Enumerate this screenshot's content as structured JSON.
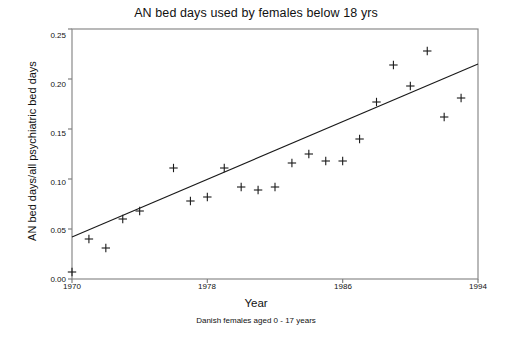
{
  "chart_data": {
    "type": "scatter",
    "title": "AN bed days used by females below 18 yrs",
    "subtitle": "Danish females aged 0 - 17 years",
    "xlabel": "Year",
    "ylabel": "AN bed days/all psychiatric bed days",
    "xlim": [
      1970,
      1994
    ],
    "ylim": [
      0.0,
      0.25
    ],
    "xticks": [
      1970,
      1978,
      1986,
      1994
    ],
    "xtick_labels": [
      "1970",
      "1978",
      "1986",
      "1994"
    ],
    "yticks": [
      0.0,
      0.05,
      0.1,
      0.15,
      0.2,
      0.25
    ],
    "ytick_labels": [
      "0.00",
      "0.05",
      "0.10",
      "0.15",
      "0.20",
      "0.25"
    ],
    "grid": false,
    "legend": null,
    "marker": "plus",
    "marker_color": "#1a1a1a",
    "line_color": "#1a1a1a",
    "background": "#ffffff",
    "frame_color": "#808080",
    "x": [
      1970,
      1971,
      1972,
      1973,
      1974,
      1976,
      1977,
      1978,
      1979,
      1980,
      1981,
      1982,
      1983,
      1984,
      1985,
      1986,
      1987,
      1988,
      1989,
      1990,
      1991,
      1992,
      1993
    ],
    "values": [
      0.007,
      0.04,
      0.031,
      0.06,
      0.068,
      0.111,
      0.078,
      0.082,
      0.111,
      0.092,
      0.089,
      0.092,
      0.116,
      0.125,
      0.118,
      0.118,
      0.14,
      0.177,
      0.214,
      0.193,
      0.228,
      0.162,
      0.181
    ],
    "points": [
      {
        "x": 1970,
        "y": 0.007
      },
      {
        "x": 1971,
        "y": 0.04
      },
      {
        "x": 1972,
        "y": 0.031
      },
      {
        "x": 1973,
        "y": 0.06
      },
      {
        "x": 1974,
        "y": 0.068
      },
      {
        "x": 1976,
        "y": 0.111
      },
      {
        "x": 1977,
        "y": 0.078
      },
      {
        "x": 1978,
        "y": 0.082
      },
      {
        "x": 1979,
        "y": 0.111
      },
      {
        "x": 1980,
        "y": 0.092
      },
      {
        "x": 1981,
        "y": 0.089
      },
      {
        "x": 1982,
        "y": 0.092
      },
      {
        "x": 1983,
        "y": 0.116
      },
      {
        "x": 1984,
        "y": 0.125
      },
      {
        "x": 1985,
        "y": 0.118
      },
      {
        "x": 1986,
        "y": 0.118
      },
      {
        "x": 1987,
        "y": 0.14
      },
      {
        "x": 1988,
        "y": 0.177
      },
      {
        "x": 1989,
        "y": 0.214
      },
      {
        "x": 1990,
        "y": 0.193
      },
      {
        "x": 1991,
        "y": 0.228
      },
      {
        "x": 1992,
        "y": 0.162
      },
      {
        "x": 1993,
        "y": 0.181
      }
    ],
    "fit_line": {
      "type": "linear-regression",
      "x0": 1970,
      "y0": 0.042,
      "x1": 1994,
      "y1": 0.215
    }
  }
}
